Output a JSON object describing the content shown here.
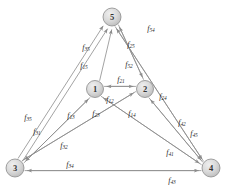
{
  "diagram": {
    "type": "directed-graph",
    "colors": {
      "node_fill": "#d4d4d4",
      "node_stroke": "#8a8a8a",
      "edge_stroke": "#8c8c8c",
      "label_text": "#2b2b2b",
      "background": "#ffffff"
    },
    "nodes": [
      {
        "id": "5",
        "label": "5",
        "x": 112,
        "y": 17,
        "r": 9
      },
      {
        "id": "1",
        "label": "1",
        "x": 95,
        "y": 89,
        "r": 8.5
      },
      {
        "id": "2",
        "label": "2",
        "x": 145,
        "y": 89,
        "r": 8.5
      },
      {
        "id": "3",
        "label": "3",
        "x": 15,
        "y": 168,
        "r": 9
      },
      {
        "id": "4",
        "label": "4",
        "x": 211,
        "y": 168,
        "r": 9
      }
    ],
    "edges": [
      {
        "id": "e-5-4",
        "from": "5",
        "to": "4",
        "label": "f",
        "sub": "54",
        "lx": 151,
        "ly": 28
      },
      {
        "id": "e-2-5",
        "from": "2",
        "to": "5",
        "label": "f",
        "sub": "25",
        "lx": 131,
        "ly": 44
      },
      {
        "id": "e-3-5",
        "from": "3",
        "to": "5",
        "label": "f",
        "sub": "35",
        "lx": 86,
        "ly": 47
      },
      {
        "id": "e-1-5",
        "from": "1",
        "to": "5",
        "label": "f",
        "sub": "15",
        "lx": 84,
        "ly": 65
      },
      {
        "id": "e-5-2",
        "from": "5",
        "to": "2",
        "label": "f",
        "sub": "52",
        "lx": 129,
        "ly": 64
      },
      {
        "id": "e-2-1",
        "from": "2",
        "to": "1",
        "label": "f",
        "sub": "21",
        "lx": 121,
        "ly": 79
      },
      {
        "id": "e-1-2",
        "from": "1",
        "to": "2",
        "label": "f",
        "sub": "12",
        "lx": 110,
        "ly": 99
      },
      {
        "id": "e-2-4",
        "from": "2",
        "to": "4",
        "label": "f",
        "sub": "24",
        "lx": 163,
        "ly": 96
      },
      {
        "id": "e-3-5b",
        "from": "3",
        "to": "5",
        "label": "f",
        "sub": "35",
        "lx": 28,
        "ly": 117
      },
      {
        "id": "e-3-1",
        "from": "3",
        "to": "1",
        "label": "f",
        "sub": "31",
        "lx": 37,
        "ly": 131
      },
      {
        "id": "e-1-3",
        "from": "1",
        "to": "3",
        "label": "f",
        "sub": "13",
        "lx": 71,
        "ly": 115
      },
      {
        "id": "e-2-3",
        "from": "2",
        "to": "3",
        "label": "f",
        "sub": "23",
        "lx": 96,
        "ly": 113
      },
      {
        "id": "e-1-4",
        "from": "1",
        "to": "4",
        "label": "f",
        "sub": "14",
        "lx": 132,
        "ly": 113
      },
      {
        "id": "e-4-2",
        "from": "4",
        "to": "2",
        "label": "f",
        "sub": "42",
        "lx": 182,
        "ly": 122
      },
      {
        "id": "e-4-5",
        "from": "4",
        "to": "5",
        "label": "f",
        "sub": "45",
        "lx": 194,
        "ly": 133
      },
      {
        "id": "e-3-2",
        "from": "3",
        "to": "2",
        "label": "f",
        "sub": "32",
        "lx": 64,
        "ly": 145
      },
      {
        "id": "e-4-1",
        "from": "4",
        "to": "1",
        "label": "f",
        "sub": "41",
        "lx": 170,
        "ly": 152
      },
      {
        "id": "e-3-4",
        "from": "3",
        "to": "4",
        "label": "f",
        "sub": "34",
        "lx": 70,
        "ly": 164
      },
      {
        "id": "e-4-3",
        "from": "4",
        "to": "3",
        "label": "f",
        "sub": "43",
        "lx": 172,
        "ly": 180
      }
    ]
  }
}
